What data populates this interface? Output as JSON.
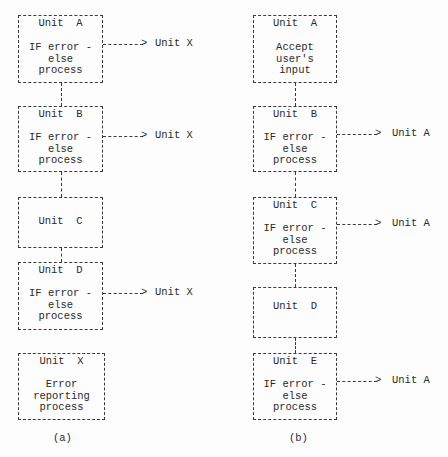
{
  "diagram_a": {
    "label": "(a)",
    "units": [
      {
        "title": "Unit  A",
        "body": "IF error -\nelse\nprocess",
        "arrow_to": "Unit X"
      },
      {
        "title": "Unit  B",
        "body": "IF error -\nelse\nprocess",
        "arrow_to": "Unit X"
      },
      {
        "title": "Unit  C",
        "body": "",
        "arrow_to": ""
      },
      {
        "title": "Unit  D",
        "body": "IF error -\nelse\nprocess",
        "arrow_to": "Unit X"
      },
      {
        "title": "Unit  X",
        "body": "Error\nreporting\nprocess",
        "arrow_to": ""
      }
    ]
  },
  "diagram_b": {
    "label": "(b)",
    "units": [
      {
        "title": "Unit  A",
        "body": "Accept\nuser's\ninput",
        "arrow_to": ""
      },
      {
        "title": "Unit  B",
        "body": "IF error -\nelse\nprocess",
        "arrow_to": "Unit A"
      },
      {
        "title": "Unit  C",
        "body": "IF error -\nelse\nprocess",
        "arrow_to": "Unit A"
      },
      {
        "title": "Unit  D",
        "body": "",
        "arrow_to": ""
      },
      {
        "title": "Unit  E",
        "body": "IF error -\nelse\nprocess",
        "arrow_to": "Unit A"
      }
    ]
  },
  "arrowhead": ">"
}
